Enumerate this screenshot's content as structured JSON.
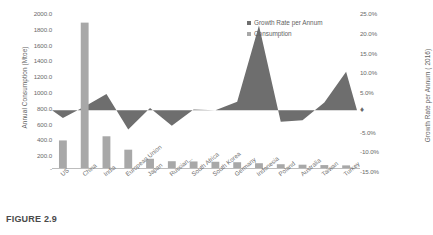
{
  "figure": {
    "caption": "FIGURE 2.9"
  },
  "legend": {
    "position": "top-right",
    "items": [
      {
        "label": "Growth Rate per Annum",
        "color": "#6e6e6e",
        "marker": "square-swatch"
      },
      {
        "label": "Consumption",
        "color": "#a8a8a8",
        "marker": "square-swatch"
      }
    ]
  },
  "axes": {
    "left": {
      "title": "Annual Consumption (Mtoe)",
      "ticks": [
        "2000.0",
        "1800.0",
        "1600.0",
        "1400.0",
        "1200.0",
        "1000.0",
        "800.0",
        "600.0",
        "400.0",
        "200.0",
        "-"
      ]
    },
    "right": {
      "title": "Growth Rate per Annum ( 2016)",
      "ticks": [
        "25.0%",
        "20.0%",
        "15.0%",
        "10.0%",
        "5.0%",
        "♦",
        "-5.0%",
        "-10.0%",
        "-15.0%"
      ]
    }
  },
  "chart_data": {
    "type": "bar",
    "title": "",
    "xlabel": "",
    "ylabel": "Annual Consumption (Mtoe)",
    "y2label": "Growth Rate per Annum ( 2016)",
    "grid": false,
    "legend_position": "top-right",
    "categories": [
      "US",
      "China",
      "India",
      "European Union",
      "Japan",
      "Russian...",
      "South Africa",
      "South Korea",
      "Germany",
      "Indonesia",
      "Poland",
      "Australia",
      "Taiwan",
      "Turkey"
    ],
    "ylim": [
      0,
      2000
    ],
    "y2lim": [
      -15,
      25
    ],
    "series": [
      {
        "name": "Consumption",
        "type": "bar",
        "axis": "left",
        "units": "Mtoe",
        "color": "#a8a8a8",
        "values": [
          358,
          1888,
          412,
          238,
          120,
          88,
          85,
          81,
          75,
          62,
          49,
          43,
          38,
          34
        ]
      },
      {
        "name": "Growth Rate per Annum",
        "type": "area",
        "axis": "right",
        "units": "%",
        "color": "#6e6e6e",
        "values": [
          -2.0,
          1.0,
          4.2,
          -5.0,
          0.6,
          -4.0,
          0.2,
          0.0,
          2.2,
          22.0,
          -3.0,
          -2.6,
          2.0,
          10.0
        ]
      }
    ]
  }
}
